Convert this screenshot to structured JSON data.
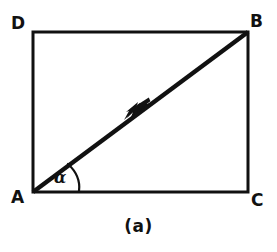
{
  "figure": {
    "caption": "(a)",
    "stroke_color": "#111111",
    "background_color": "#ffffff",
    "type": "geometry-diagram"
  },
  "vertices": [
    {
      "id": "D",
      "label": "D",
      "x": 33,
      "y": 32,
      "label_x": 11,
      "label_y": 15
    },
    {
      "id": "B",
      "label": "B",
      "x": 248,
      "y": 32,
      "label_x": 250,
      "label_y": 13
    },
    {
      "id": "A",
      "label": "A",
      "x": 33,
      "y": 192,
      "label_x": 11,
      "label_y": 189
    },
    {
      "id": "C",
      "label": "C",
      "x": 248,
      "y": 192,
      "label_x": 251,
      "label_y": 192
    }
  ],
  "rectangle": {
    "left": 33,
    "top": 32,
    "right": 248,
    "bottom": 192,
    "width": 215,
    "height": 160,
    "stroke_width": 3
  },
  "diagonal": {
    "from": "A",
    "to": "B",
    "x1": 33,
    "y1": 192,
    "x2": 248,
    "y2": 32,
    "stroke_width": 4.4,
    "arrow": {
      "name": "arrowhead",
      "tip_x": 148,
      "tip_y": 106,
      "position_fraction": 0.53
    }
  },
  "angle": {
    "symbol": "α",
    "at_vertex": "A",
    "between": [
      "AC",
      "AB"
    ],
    "arc": {
      "start_x": 69,
      "start_y": 165,
      "end_x": 79,
      "end_y": 191,
      "radius": 45,
      "stroke_width": 2
    }
  }
}
